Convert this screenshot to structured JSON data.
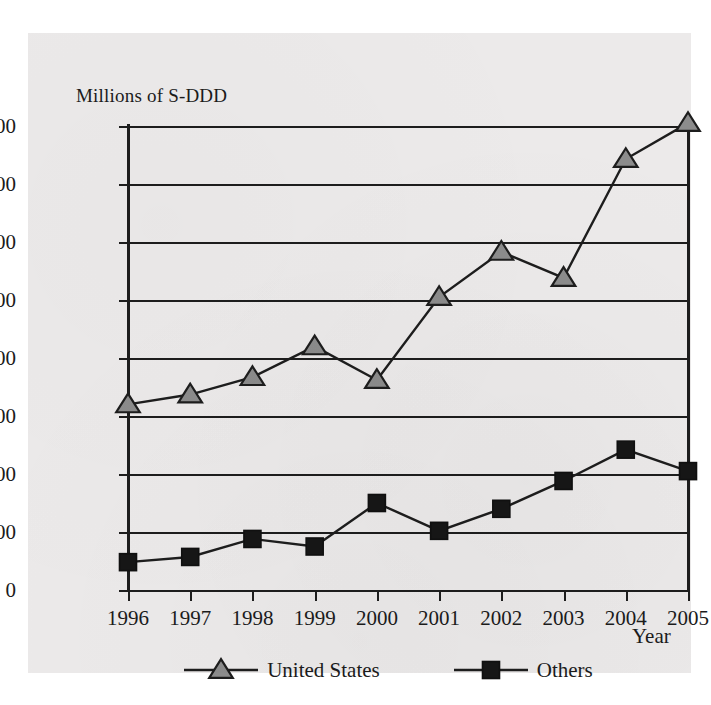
{
  "chart_data": {
    "type": "line",
    "title": "",
    "xlabel": "Year",
    "ylabel": "Millions of S-DDD",
    "categories": [
      "1996",
      "1997",
      "1998",
      "1999",
      "2000",
      "2001",
      "2002",
      "2003",
      "2004",
      "2005"
    ],
    "series": [
      {
        "name": "United States",
        "marker": "triangle",
        "color": "#8c8c8c",
        "values": [
          320,
          337,
          367,
          420,
          362,
          505,
          583,
          538,
          743,
          805
        ]
      },
      {
        "name": "Others",
        "marker": "square",
        "color": "#161616",
        "values": [
          48,
          57,
          88,
          75,
          150,
          102,
          140,
          188,
          242,
          205
        ]
      }
    ],
    "ylim": [
      0,
      800
    ],
    "yticks": [
      "0",
      "100",
      "200",
      "300",
      "400",
      "500",
      "600",
      "700",
      "800"
    ],
    "grid": true,
    "legend_position": "bottom"
  },
  "legend": {
    "entries": [
      {
        "label": "United States",
        "icon": "triangle-marker"
      },
      {
        "label": "Others",
        "icon": "square-marker"
      }
    ]
  },
  "colors": {
    "panel": "#eceaea",
    "ink": "#1b1b1b",
    "us_marker": "#8c8c8c",
    "others_marker": "#161616"
  }
}
